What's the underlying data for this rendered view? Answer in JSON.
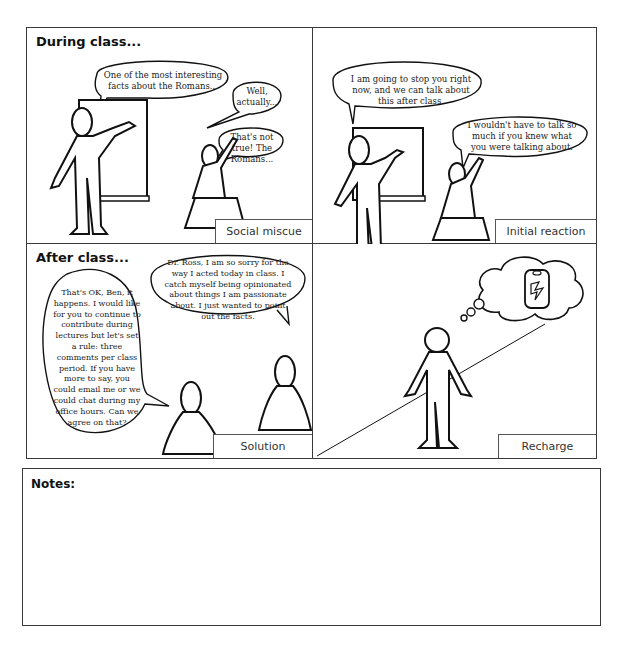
{
  "panels": [
    {
      "title": "During class...",
      "caption": "Social miscue",
      "bubbles": [
        "One of the most interesting facts about the Romans...",
        "Well, actually...",
        "That's not true! The Romans..."
      ]
    },
    {
      "title": "",
      "caption": "Initial reaction",
      "bubbles": [
        "I am going to stop you right now, and we can talk about this after class.",
        "I wouldn't have to talk so much if you knew what you were talking about."
      ]
    },
    {
      "title": "After class...",
      "caption": "Solution",
      "bubbles": [
        "That's OK, Ben, it happens. I would like for you to continue to contribute during lectures but let's set a rule: three comments per class period. If you have more to say, you could email me or we could chat during my office hours. Can we agree on that?",
        "Dr. Ross, I am so sorry for the way I acted today in class. I catch myself being opinionated about things I am passionate about. I just wanted to point out the facts."
      ]
    },
    {
      "title": "",
      "caption": "Recharge",
      "thought": "battery-icon"
    }
  ],
  "notes": {
    "title": "Notes:"
  }
}
